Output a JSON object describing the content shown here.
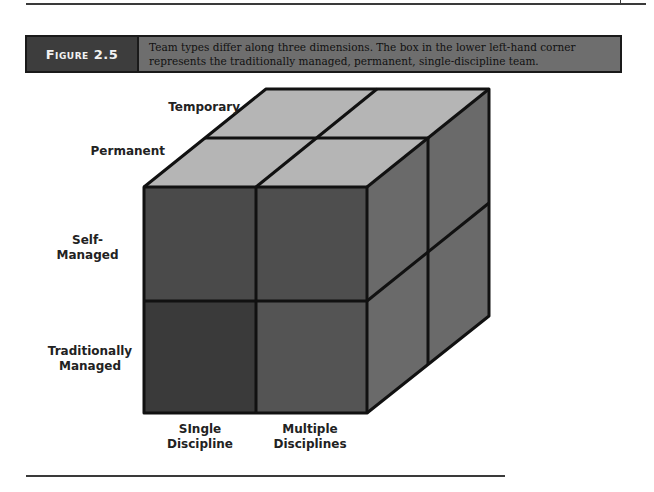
{
  "figure": {
    "label": "Figure 2.5",
    "caption": "Team types differ along three dimensions. The box in the lower left-hand corner represents the traditionally managed, permanent, single-discipline team."
  },
  "diagram": {
    "type": "3d-cube",
    "depth_labels": [
      "Temporary",
      "Permanent"
    ],
    "vertical_labels": [
      "Self-\nManaged",
      "Traditionally\nManaged"
    ],
    "horizontal_labels": [
      "SIngle\nDiscipline",
      "Multiple\nDisciplines"
    ],
    "highlighted_cell": "traditionally managed, permanent, single-discipline",
    "colors": {
      "top_face": "#b5b5b5",
      "front_face": "#4a4a4a",
      "front_highlight": "#3a3a3a",
      "side_face": "#6a6a6a",
      "edge": "#111111",
      "banner_label_bg": "#3d3d3d",
      "banner_caption_bg": "#6e6e6e"
    }
  },
  "labels": {
    "temporary": "Temporary",
    "permanent": "Permanent",
    "self_managed_1": "Self-",
    "self_managed_2": "Managed",
    "traditional_1": "Traditionally",
    "traditional_2": "Managed",
    "single_1": "SIngle",
    "single_2": "Discipline",
    "multiple_1": "Multiple",
    "multiple_2": "Disciplines"
  }
}
